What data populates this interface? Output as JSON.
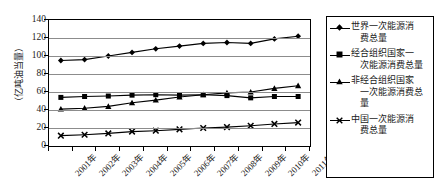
{
  "chart_data": {
    "type": "line",
    "title": "",
    "xlabel": "",
    "ylabel": "（亿吨油当量）",
    "ylim": [
      0,
      140
    ],
    "ytick_step": 20,
    "yticks": [
      "0",
      "20",
      "40",
      "60",
      "80",
      "100",
      "120",
      "140"
    ],
    "grid": true,
    "legend_position": "right",
    "categories": [
      "2001年",
      "2002年",
      "2003年",
      "2004年",
      "2005年",
      "2006年",
      "2007年",
      "2008年",
      "2009年",
      "2010年",
      "2011年"
    ],
    "series": [
      {
        "name": "世界一次能源消费总量",
        "marker": "diamond",
        "color": "#000000",
        "values": [
          95,
          96,
          100,
          104,
          108,
          111,
          114,
          115,
          114,
          119,
          122
        ]
      },
      {
        "name": "经合组织国家一次能源消费总量",
        "marker": "square",
        "color": "#000000",
        "values": [
          54,
          55,
          55.5,
          56.5,
          57,
          56.5,
          57,
          56,
          53.5,
          55,
          55
        ]
      },
      {
        "name": "非经合组织国家一次能源消费总量",
        "marker": "triangle",
        "color": "#000000",
        "values": [
          41,
          42,
          44,
          48,
          51,
          54.5,
          57,
          59,
          60,
          64,
          67
        ]
      },
      {
        "name": "中国一次能源消费总量",
        "marker": "cross",
        "color": "#000000",
        "values": [
          11.5,
          12.5,
          14,
          16,
          17,
          18.5,
          20,
          21,
          22.5,
          24.5,
          26
        ]
      }
    ]
  },
  "legend": {
    "items": [
      {
        "label_line1": "世界一次能源消",
        "label_line2": "费总量",
        "marker": "diamond-marker"
      },
      {
        "label_line1": "经合组织国家一",
        "label_line2": "次能源消费总量",
        "marker": "square-marker"
      },
      {
        "label_line1": "非经合组织国家",
        "label_line2": "一次能源消费总",
        "label_line3": "量",
        "marker": "triangle-marker"
      },
      {
        "label_line1": "中国一次能源消",
        "label_line2": "费总量",
        "marker": "cross-marker"
      }
    ]
  },
  "axes": {
    "y_title": "（亿吨油当量）"
  }
}
